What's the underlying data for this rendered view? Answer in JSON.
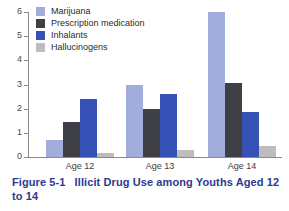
{
  "figure": {
    "caption_number": "Figure 5-1",
    "caption_title": "Illicit Drug Use among Youths Aged 12 to 14",
    "caption_color": "#2b3a8f"
  },
  "legend": {
    "position": "top-left",
    "items": [
      {
        "label": "Marijuana",
        "color": "#a3addc",
        "swatch_name": "legend-swatch-marijuana"
      },
      {
        "label": "Prescription medication",
        "color": "#3f3f46",
        "swatch_name": "legend-swatch-prescription-medication"
      },
      {
        "label": "Inhalants",
        "color": "#3551b5",
        "swatch_name": "legend-swatch-inhalants"
      },
      {
        "label": "Hallucinogens",
        "color": "#bdbdbd",
        "swatch_name": "legend-swatch-hallucinogens"
      }
    ]
  },
  "axis": {
    "y_ticks": [
      "6",
      "5",
      "4",
      "3",
      "2",
      "1",
      "0"
    ],
    "x_labels": [
      "Age 12",
      "Age 13",
      "Age 14"
    ]
  },
  "chart_data": {
    "type": "bar",
    "title": "Illicit Drug Use among Youths Aged 12 to 14",
    "xlabel": "",
    "ylabel": "",
    "ylim": [
      0,
      6
    ],
    "yticks": [
      0,
      1,
      2,
      3,
      4,
      5,
      6
    ],
    "grid": false,
    "legend_position": "upper left",
    "categories": [
      "Age 12",
      "Age 13",
      "Age 14"
    ],
    "series": [
      {
        "name": "Marijuana",
        "color": "#a3addc",
        "values": [
          0.7,
          3.0,
          6.0
        ]
      },
      {
        "name": "Prescription medication",
        "color": "#3f3f46",
        "values": [
          1.45,
          2.0,
          3.05
        ]
      },
      {
        "name": "Inhalants",
        "color": "#3551b5",
        "values": [
          2.4,
          2.6,
          1.85
        ]
      },
      {
        "name": "Hallucinogens",
        "color": "#bdbdbd",
        "values": [
          0.15,
          0.3,
          0.45
        ]
      }
    ]
  }
}
